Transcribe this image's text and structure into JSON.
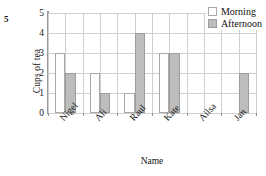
{
  "question_number": "5",
  "chart_data": {
    "type": "bar",
    "title": "",
    "xlabel": "Name",
    "ylabel": "Cups of tea",
    "categories": [
      "Nigel",
      "Ali",
      "Raul",
      "Kate",
      "Ailsa",
      "Jan"
    ],
    "series": [
      {
        "name": "Morning",
        "values": [
          3,
          2,
          1,
          3,
          0,
          0
        ],
        "color": "#ffffff"
      },
      {
        "name": "Afternoon",
        "values": [
          2,
          1,
          4,
          3,
          0,
          2
        ],
        "color": "#bdbdbd"
      }
    ],
    "ylim": [
      0,
      5
    ],
    "ytick_labels": [
      "0",
      "1",
      "2",
      "3",
      "4",
      "5"
    ],
    "grid": true,
    "legend_position": "top-right"
  },
  "legend": {
    "entries": [
      {
        "label": "Morning"
      },
      {
        "label": "Afternoon"
      }
    ]
  },
  "colors": {
    "morning_fill": "#ffffff",
    "afternoon_fill": "#bdbdbd",
    "bar_outline": "#a9a9a9",
    "grid_line": "#cfcfcf",
    "axis_line": "#9a9a9a"
  }
}
